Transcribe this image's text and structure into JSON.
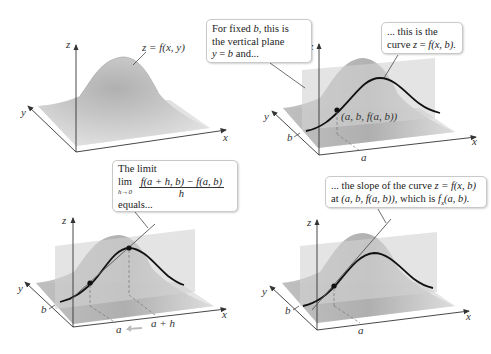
{
  "panels": [
    {
      "id": "surface",
      "axes": {
        "x": "x",
        "y": "y",
        "z": "z"
      },
      "surface_label": "z = f(x, y)"
    },
    {
      "id": "plane-and-curve",
      "axes": {
        "x": "x",
        "y": "y",
        "z": "z"
      },
      "callouts": {
        "plane": {
          "line1": "For fixed ",
          "b1": "b",
          "line1b": ", this is",
          "line2": "the vertical plane",
          "line3a": "y",
          "line3b": " = ",
          "line3c": "b",
          "line3d": " and..."
        },
        "curve": {
          "line1": "... this is the",
          "line2a": "curve ",
          "line2b": "z",
          "line2c": " = ",
          "line2d": "f",
          "line2e": "(x, b)."
        }
      },
      "point_label": "(a, b, f(a, b))",
      "tick_labels": {
        "a": "a",
        "b": "b"
      }
    },
    {
      "id": "secant",
      "axes": {
        "x": "x",
        "y": "y",
        "z": "z"
      },
      "callout": {
        "line1": "The limit",
        "lim": "lim",
        "lim_sub": "h→0",
        "numerator": "f(a + h, b) − f(a, b)",
        "denominator": "h",
        "line3": "equals..."
      },
      "tick_labels": {
        "a": "a",
        "a_plus_h": "a + h",
        "b": "b"
      }
    },
    {
      "id": "tangent",
      "axes": {
        "x": "x",
        "y": "y",
        "z": "z"
      },
      "callout": {
        "line1a": "... the slope of the curve ",
        "line1b": "z = f(x, b)",
        "line2a": "at ",
        "line2b": "(a, b, f(a, b))",
        "line2c": ", which is ",
        "line2d": "f",
        "line2sub": "x",
        "line2e": "(a, b)."
      },
      "tick_labels": {
        "a": "a",
        "b": "b"
      }
    }
  ],
  "colors": {
    "surface_light": "#e6e6e6",
    "surface_dark": "#9a9a9a",
    "plane": "#cfcfcf",
    "curve": "#111111",
    "axis": "#333333",
    "dashed": "#777777",
    "callout_border": "#c9c9c9"
  }
}
